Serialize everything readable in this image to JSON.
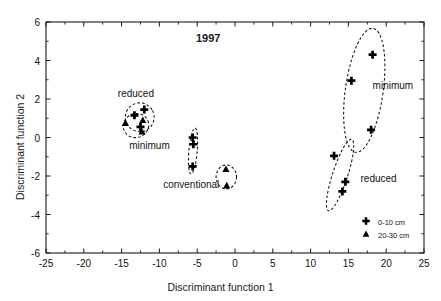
{
  "chart_data": {
    "type": "scatter",
    "title": "1997",
    "xlabel": "Discriminant function 1",
    "ylabel": "Discriminant function 2",
    "xlim": [
      -25,
      25
    ],
    "ylim": [
      -6,
      6
    ],
    "xticks": [
      "-25",
      "-20",
      "-15",
      "-10",
      "-5",
      "0",
      "5",
      "10",
      "15",
      "20",
      "25"
    ],
    "xtick_values": [
      -25,
      -20,
      -15,
      -10,
      -5,
      0,
      5,
      10,
      15,
      20,
      25
    ],
    "yticks": [
      "6",
      "4",
      "2",
      "0",
      "-2",
      "-4",
      "-6"
    ],
    "ytick_values": [
      6,
      4,
      2,
      0,
      -2,
      -4,
      -6
    ],
    "grid": false,
    "legend_position": "bottom-right",
    "legend": [
      {
        "marker": "cross",
        "label": "0-10 cm"
      },
      {
        "marker": "triangle",
        "label": "20-30 cm"
      }
    ],
    "series": [
      {
        "name": "0-10 cm",
        "marker": "cross",
        "points": [
          {
            "x": -13.3,
            "y": 1.15
          },
          {
            "x": -12.0,
            "y": 1.45
          },
          {
            "x": -12.5,
            "y": 0.55
          },
          {
            "x": -5.6,
            "y": 0.0
          },
          {
            "x": -5.5,
            "y": -0.35
          },
          {
            "x": -5.6,
            "y": -1.5
          },
          {
            "x": 18.2,
            "y": 4.3
          },
          {
            "x": 15.4,
            "y": 2.95
          },
          {
            "x": 18.0,
            "y": 0.4
          },
          {
            "x": 13.1,
            "y": -0.95
          },
          {
            "x": 14.6,
            "y": -2.3
          },
          {
            "x": 14.2,
            "y": -2.8
          }
        ]
      },
      {
        "name": "20-30 cm",
        "marker": "triangle",
        "points": [
          {
            "x": -14.5,
            "y": 0.75
          },
          {
            "x": -12.3,
            "y": 0.3
          },
          {
            "x": -12.2,
            "y": 0.9
          },
          {
            "x": -1.2,
            "y": -1.65
          },
          {
            "x": -1.1,
            "y": -2.5
          }
        ]
      }
    ],
    "ellipses": [
      {
        "label": "reduced-left",
        "cx": -12.6,
        "cy": 1.05,
        "rx": 1.9,
        "ry": 0.75,
        "angle": -28
      },
      {
        "label": "minimum-left",
        "cx": -13.1,
        "cy": 0.62,
        "rx": 1.7,
        "ry": 0.62,
        "angle": -22
      },
      {
        "label": "conventional",
        "cx": -5.55,
        "cy": -0.7,
        "rx": 0.55,
        "ry": 1.2,
        "angle": 5
      },
      {
        "label": "conventional-deep",
        "cx": -1.15,
        "cy": -2.05,
        "rx": 1.35,
        "ry": 0.62,
        "angle": 0
      },
      {
        "label": "minimum-right",
        "cx": 17.1,
        "cy": 2.45,
        "rx": 2.5,
        "ry": 3.25,
        "angle": 8
      },
      {
        "label": "reduced-right",
        "cx": 13.9,
        "cy": -1.95,
        "rx": 1.0,
        "ry": 1.95,
        "angle": 18
      }
    ],
    "annotations": [
      {
        "text": "reduced",
        "x": -15.5,
        "y": 2.2
      },
      {
        "text": "minimum",
        "x": -14.0,
        "y": -0.5
      },
      {
        "text": "conventional",
        "x": -9.5,
        "y": -2.5
      },
      {
        "text": "minimum",
        "x": 18.2,
        "y": 2.6
      },
      {
        "text": "reduced",
        "x": 16.6,
        "y": -2.2
      }
    ]
  },
  "figure": {
    "title": "1997",
    "x_axis_title": "Discriminant function 1",
    "y_axis_title": "Discriminant function 2",
    "xticks": [
      "-25",
      "-20",
      "-15",
      "-10",
      "-5",
      "0",
      "5",
      "10",
      "15",
      "20",
      "25"
    ],
    "yticks": [
      "6",
      "4",
      "2",
      "0",
      "-2",
      "-4",
      "-6"
    ],
    "cluster_labels": {
      "left_upper": "reduced",
      "left_lower": "minimum",
      "middle": "conventional",
      "right_upper": "minimum",
      "right_lower": "reduced"
    },
    "legend": {
      "item1_label": "0-10 cm",
      "item2_label": "20-30 cm"
    },
    "colors": {
      "axis": "#1a1a1a",
      "marker": "#000000",
      "background": "#ffffff"
    }
  }
}
